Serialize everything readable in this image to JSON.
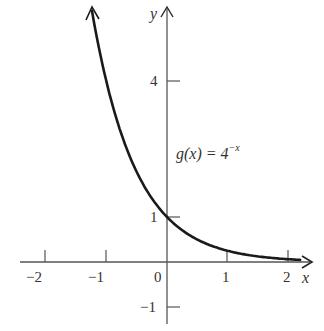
{
  "chart_data": {
    "type": "line",
    "title": "",
    "function_label": {
      "lhs": "g(x) = 4",
      "exp": "−x"
    },
    "xlabel": "x",
    "ylabel": "y",
    "x_ticks": [
      "−2",
      "−1",
      "0",
      "1",
      "2"
    ],
    "y_ticks": [
      "4",
      "1",
      "−1"
    ],
    "xlim": [
      -2.4,
      2.3
    ],
    "ylim": [
      -1.3,
      5.7
    ],
    "grid": false,
    "series": [
      {
        "name": "g(x) = 4^(-x)",
        "x": [
          -1.24,
          -1.0,
          -0.75,
          -0.5,
          -0.25,
          0,
          0.25,
          0.5,
          0.75,
          1.0,
          1.5,
          2.0,
          2.2
        ],
        "values": [
          5.58,
          4.0,
          2.83,
          2.0,
          1.41,
          1.0,
          0.71,
          0.5,
          0.35,
          0.25,
          0.125,
          0.0625,
          0.047
        ]
      }
    ],
    "colors": {
      "curve": "#1a1a1a",
      "axes": "#444444"
    }
  }
}
